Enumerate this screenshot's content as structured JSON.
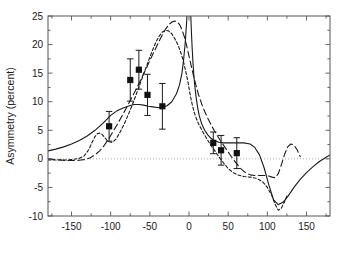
{
  "chart_data": {
    "type": "scatter",
    "title": "",
    "xlabel": "",
    "ylabel": "Asymmetry (percent)",
    "xlim": [
      -180,
      180
    ],
    "ylim": [
      -10,
      25
    ],
    "grid": false,
    "legend": "none",
    "xticks": [
      -150,
      -100,
      -50,
      0,
      50,
      100,
      150
    ],
    "xtick_labels": [
      "-150",
      "-100",
      "-50",
      "0",
      "50",
      "100",
      "150"
    ],
    "xminor_ticks": [
      -175,
      -125,
      -75,
      -25,
      25,
      75,
      125,
      175
    ],
    "yticks": [
      -10,
      -5,
      0,
      5,
      10,
      15,
      20,
      25
    ],
    "ytick_labels": [
      "-10",
      "-5",
      "0",
      "5",
      "10",
      "15",
      "20",
      "25"
    ],
    "zero_reference_line": 0,
    "series": [
      {
        "name": "measured-asymmetry",
        "type": "scatter",
        "marker": "filled-square",
        "x": [
          -102,
          -75,
          -64,
          -53,
          -34,
          31,
          41,
          61
        ],
        "y": [
          5.7,
          13.8,
          15.6,
          11.2,
          9.2,
          2.8,
          1.5,
          1.0
        ],
        "yerr": [
          2.6,
          3.7,
          3.4,
          3.6,
          4.0,
          1.9,
          2.6,
          2.7
        ]
      },
      {
        "name": "curve-solid",
        "type": "line",
        "style": "solid",
        "x": [
          -180,
          -170,
          -160,
          -150,
          -140,
          -130,
          -120,
          -110,
          -100,
          -92,
          -84,
          -76,
          -70,
          -64,
          -58,
          -52,
          -46,
          -40,
          -34,
          -28,
          -22,
          -16,
          -12,
          -9,
          -7,
          -5,
          -4,
          -3,
          -2,
          -1,
          0,
          1,
          2,
          3,
          4,
          5,
          6,
          7,
          9,
          11,
          13,
          16,
          20,
          24,
          28,
          32,
          38,
          44,
          50,
          56,
          62,
          70,
          78,
          84,
          90,
          96,
          102,
          108,
          114,
          120,
          126,
          134,
          142,
          150,
          158,
          166,
          174,
          180
        ],
        "y": [
          1.4,
          1.7,
          2.1,
          2.6,
          3.2,
          4.0,
          5.0,
          6.2,
          7.6,
          8.4,
          8.9,
          9.3,
          9.5,
          9.5,
          9.4,
          9.2,
          9.1,
          9.0,
          9.0,
          9.3,
          10.0,
          11.4,
          13.0,
          15.0,
          17.2,
          20.0,
          22.0,
          24.0,
          26.5,
          29.5,
          32.5,
          30.0,
          26.0,
          22.5,
          19.5,
          17.0,
          15.0,
          13.3,
          10.9,
          9.0,
          7.6,
          6.2,
          5.0,
          4.2,
          3.6,
          3.2,
          2.9,
          2.8,
          2.8,
          2.8,
          2.8,
          2.8,
          2.6,
          2.0,
          0.7,
          -1.6,
          -4.6,
          -7.2,
          -8.0,
          -7.6,
          -6.6,
          -5.0,
          -3.6,
          -2.4,
          -1.4,
          -0.5,
          0.2,
          0.7
        ]
      },
      {
        "name": "curve-dotted",
        "type": "line",
        "style": "short-dashed",
        "x": [
          -180,
          -172,
          -164,
          -156,
          -148,
          -140,
          -134,
          -128,
          -124,
          -120,
          -117,
          -114,
          -111,
          -108,
          -105,
          -102,
          -99,
          -96,
          -93,
          -90,
          -86,
          -82,
          -78,
          -74,
          -70,
          -66,
          -62,
          -58,
          -54,
          -50,
          -46,
          -42,
          -38,
          -34,
          -30,
          -26,
          -22,
          -18,
          -14,
          -10,
          -7,
          -5,
          -3,
          -1,
          1,
          3,
          5,
          7,
          9,
          12,
          15,
          18,
          22,
          26,
          30,
          34,
          38,
          44,
          50,
          56,
          62,
          70,
          78,
          86,
          94,
          100,
          106,
          110,
          114,
          118,
          122,
          126
        ],
        "y": [
          -0.2,
          -0.2,
          -0.2,
          -0.2,
          -0.1,
          0.1,
          0.5,
          1.6,
          2.8,
          3.9,
          4.4,
          4.5,
          4.3,
          3.8,
          3.3,
          3.0,
          2.9,
          3.1,
          3.5,
          4.2,
          5.2,
          6.3,
          7.6,
          8.9,
          10.3,
          11.8,
          13.3,
          14.8,
          16.3,
          17.8,
          19.2,
          20.5,
          21.5,
          22.2,
          22.5,
          22.4,
          21.9,
          21.0,
          19.9,
          18.4,
          17.0,
          15.8,
          14.6,
          13.2,
          11.6,
          10.2,
          9.0,
          8.0,
          7.2,
          6.2,
          5.4,
          4.6,
          3.7,
          2.8,
          2.0,
          1.2,
          0.4,
          -0.7,
          -1.7,
          -2.4,
          -2.8,
          -3.1,
          -3.2,
          -3.4,
          -4.0,
          -5.0,
          -6.5,
          -8.0,
          -9.0,
          -8.6,
          -7.5,
          -6.2
        ]
      },
      {
        "name": "curve-dashed",
        "type": "line",
        "style": "long-dashed",
        "x": [
          -180,
          -172,
          -164,
          -156,
          -150,
          -144,
          -138,
          -132,
          -126,
          -120,
          -114,
          -108,
          -102,
          -96,
          -90,
          -84,
          -78,
          -72,
          -66,
          -60,
          -54,
          -48,
          -42,
          -36,
          -30,
          -25,
          -21,
          -18,
          -15,
          -12,
          -9,
          -6,
          -3,
          0,
          3,
          6,
          9,
          12,
          16,
          20,
          24,
          28,
          32,
          36,
          40,
          44,
          48,
          52,
          56,
          60,
          66,
          72,
          78,
          84,
          90,
          96,
          102,
          106,
          110,
          114,
          118,
          122,
          126,
          130,
          134,
          138,
          142
        ],
        "y": [
          0.0,
          -0.1,
          -0.2,
          -0.3,
          -0.3,
          -0.3,
          -0.2,
          -0.1,
          0.2,
          0.7,
          1.4,
          2.4,
          3.6,
          5.0,
          6.4,
          7.9,
          9.4,
          11.0,
          12.6,
          14.3,
          16.0,
          17.8,
          19.5,
          21.2,
          22.7,
          23.6,
          24.0,
          24.1,
          24.0,
          23.5,
          22.6,
          21.4,
          19.8,
          18.0,
          16.2,
          14.4,
          12.8,
          11.3,
          9.7,
          8.3,
          7.1,
          6.0,
          5.0,
          4.1,
          3.2,
          2.4,
          1.6,
          0.8,
          0.0,
          -0.7,
          -1.7,
          -2.4,
          -2.8,
          -2.9,
          -2.9,
          -2.9,
          -3.0,
          -3.2,
          -3.3,
          -2.6,
          -1.0,
          0.8,
          2.1,
          2.6,
          2.4,
          1.6,
          0.4
        ]
      }
    ]
  }
}
